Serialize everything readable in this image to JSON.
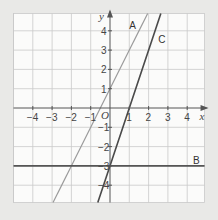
{
  "chart_data": {
    "type": "line",
    "title": "",
    "xlabel": "x",
    "ylabel": "y",
    "origin_label": "O",
    "xlim": [
      -5,
      4.9
    ],
    "ylim": [
      -4.9,
      4.9
    ],
    "grid": true,
    "x_ticks": [
      -4,
      -3,
      -2,
      -1,
      1,
      2,
      3,
      4
    ],
    "y_ticks": [
      -4,
      -3,
      -2,
      -1,
      1,
      2,
      3,
      4
    ],
    "x_tick_labels": [
      "−4",
      "−3",
      "−2",
      "−1",
      "1",
      "2",
      "3",
      "4"
    ],
    "y_tick_labels": [
      "−4",
      "−3",
      "−2",
      "−1",
      "1",
      "2",
      "3",
      "4"
    ],
    "series": [
      {
        "name": "A",
        "equation": "y = 2x + 1",
        "slope": 2,
        "intercept": 1,
        "color": "#9a9a9a",
        "label_pos": [
          1.0,
          4.3
        ]
      },
      {
        "name": "B",
        "equation": "y = -3",
        "slope": 0,
        "intercept": -3,
        "color": "#555555",
        "label_pos": [
          4.3,
          -2.7
        ]
      },
      {
        "name": "C",
        "equation": "y = 3x - 3",
        "slope": 3,
        "intercept": -3,
        "color": "#4a4a4a",
        "label_pos": [
          2.5,
          3.6
        ]
      }
    ]
  },
  "layout": {
    "origin_px": [
      110,
      108
    ],
    "unit_px": 19.3,
    "background": "#e9e9e7",
    "plot_bg": "#fbfbfa",
    "grid_color": "#c9c9c9",
    "axis_color": "#555555"
  }
}
